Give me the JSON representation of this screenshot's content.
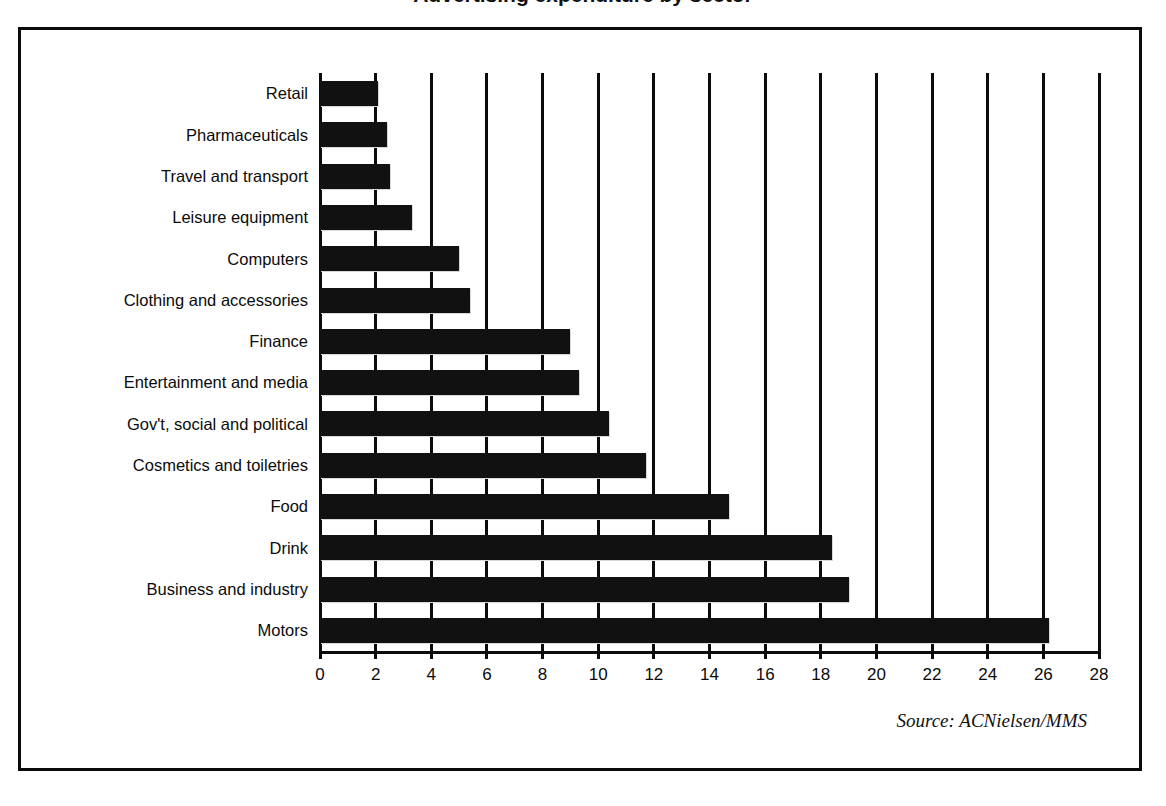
{
  "title": {
    "text": "Advertising expenditure by sector",
    "clipped": true
  },
  "source_note": "Source: ACNielsen/MMS",
  "chart_data": {
    "type": "bar",
    "orientation": "horizontal",
    "title": "Advertising expenditure by sector",
    "xlabel": "",
    "ylabel": "",
    "xlim": [
      0,
      28
    ],
    "xticks": [
      0,
      2,
      4,
      6,
      8,
      10,
      12,
      14,
      16,
      18,
      20,
      22,
      24,
      26,
      28
    ],
    "grid": true,
    "grid_axis": "x",
    "legend": false,
    "bar_color": "#111111",
    "categories": [
      "Retail",
      "Pharmaceuticals",
      "Travel and transport",
      "Leisure equipment",
      "Computers",
      "Clothing and accessories",
      "Finance",
      "Entertainment and media",
      "Gov't, social and political",
      "Cosmetics and toiletries",
      "Food",
      "Drink",
      "Business and industry",
      "Motors"
    ],
    "values": [
      2.1,
      2.4,
      2.5,
      3.3,
      5.0,
      5.4,
      9.0,
      9.3,
      10.4,
      11.7,
      14.7,
      18.4,
      19.0,
      26.2
    ]
  }
}
